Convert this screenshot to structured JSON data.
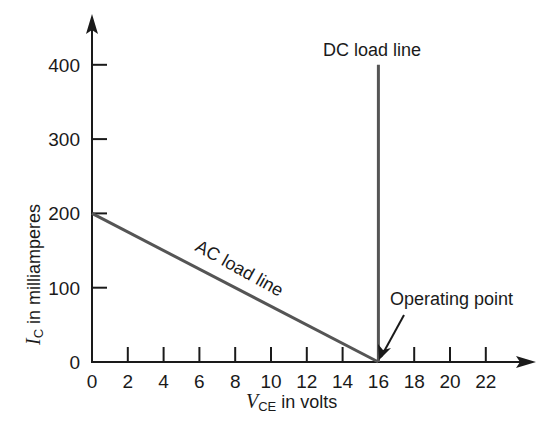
{
  "chart_data": {
    "type": "line",
    "title": "",
    "xlabel": "V_CE in volts",
    "xlabel_parts": {
      "symbol": "V",
      "subscript": "CE",
      "rest": " in volts"
    },
    "ylabel": "I_C in milliamperes",
    "ylabel_parts": {
      "symbol": "I",
      "subscript": "C",
      "rest": " in milliamperes"
    },
    "xlim": [
      0,
      24
    ],
    "ylim": [
      0,
      440
    ],
    "x_ticks": [
      0,
      2,
      4,
      6,
      8,
      10,
      12,
      14,
      16,
      18,
      20,
      22
    ],
    "y_ticks": [
      0,
      100,
      200,
      300,
      400
    ],
    "grid": false,
    "series": [
      {
        "name": "AC load line",
        "x": [
          0,
          16
        ],
        "y": [
          200,
          0
        ]
      },
      {
        "name": "DC load line",
        "x": [
          16,
          16
        ],
        "y": [
          0,
          400
        ]
      }
    ],
    "annotations": [
      {
        "text": "DC load line",
        "x": 16,
        "y": 420
      },
      {
        "text": "AC load line",
        "x": 8,
        "y": 100,
        "rotation_deg": -29
      },
      {
        "text": "Operating point",
        "x": 16,
        "y": 0,
        "arrow": true
      }
    ],
    "operating_point": {
      "x": 16,
      "y": 0
    },
    "colors": {
      "axes": "#1a1a1a",
      "lines": "#555555",
      "text": "#1a1a1a"
    }
  }
}
